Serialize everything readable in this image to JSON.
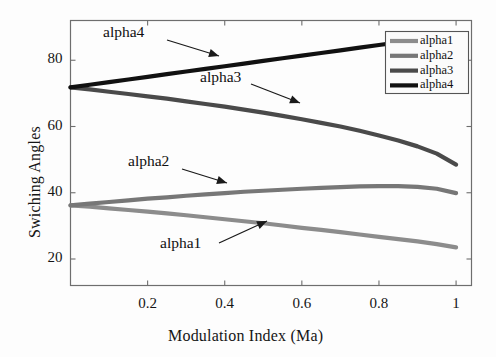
{
  "chart_data": {
    "type": "line",
    "title": "",
    "xlabel": "Modulation Index (Ma)",
    "ylabel": "Swiching Angles",
    "xlim": [
      0,
      1.04
    ],
    "ylim": [
      12,
      92
    ],
    "xticks": [
      0.2,
      0.4,
      0.6,
      0.8,
      1
    ],
    "xticklabels": [
      "0.2",
      "0.4",
      "0.6",
      "0.8",
      "1"
    ],
    "yticks": [
      20,
      40,
      60,
      80
    ],
    "yticklabels": [
      "20",
      "40",
      "60",
      "80"
    ],
    "grid": false,
    "legend_position": "upper right",
    "x": [
      0,
      0.05,
      0.1,
      0.15,
      0.2,
      0.25,
      0.3,
      0.35,
      0.4,
      0.45,
      0.5,
      0.55,
      0.6,
      0.65,
      0.7,
      0.75,
      0.8,
      0.85,
      0.9,
      0.95,
      1
    ],
    "series": [
      {
        "name": "alpha1",
        "color": "#8c8c8c",
        "values": [
          36.2,
          35.8,
          35.3,
          34.8,
          34.3,
          33.8,
          33.2,
          32.6,
          32.0,
          31.4,
          30.8,
          30.1,
          29.4,
          28.8,
          28.1,
          27.4,
          26.7,
          26.0,
          25.3,
          24.5,
          23.5
        ]
      },
      {
        "name": "alpha2",
        "color": "#777777",
        "values": [
          36.2,
          36.7,
          37.2,
          37.7,
          38.2,
          38.6,
          39.1,
          39.5,
          39.9,
          40.3,
          40.6,
          40.9,
          41.2,
          41.5,
          41.7,
          41.9,
          42.0,
          42.0,
          41.8,
          41.2,
          39.9
        ]
      },
      {
        "name": "alpha3",
        "color": "#4a4a4a",
        "values": [
          71.8,
          71.2,
          70.5,
          69.8,
          69.1,
          68.4,
          67.6,
          66.8,
          66.0,
          65.1,
          64.2,
          63.2,
          62.2,
          61.1,
          60.0,
          58.7,
          57.3,
          55.8,
          54.0,
          51.8,
          48.5
        ]
      },
      {
        "name": "alpha4",
        "color": "#111111",
        "values": [
          71.8,
          72.6,
          73.4,
          74.2,
          75.0,
          75.8,
          76.6,
          77.4,
          78.2,
          79.0,
          79.8,
          80.6,
          81.4,
          82.2,
          83.0,
          83.8,
          84.6,
          85.4,
          86.2,
          87.0,
          87.9
        ]
      }
    ],
    "annotations": [
      {
        "text": "alpha4",
        "label_x": 103,
        "label_y": 32,
        "arrow_from_x": 167,
        "arrow_from_y": 40,
        "arrow_to_x": 219,
        "arrow_to_y": 56
      },
      {
        "text": "alpha3",
        "label_x": 200,
        "label_y": 77,
        "arrow_from_x": 251,
        "arrow_from_y": 84,
        "arrow_to_x": 300,
        "arrow_to_y": 103
      },
      {
        "text": "alpha2",
        "label_x": 128,
        "label_y": 161,
        "arrow_from_x": 182,
        "arrow_from_y": 169,
        "arrow_to_x": 227,
        "arrow_to_y": 183
      },
      {
        "text": "alpha1",
        "label_x": 160,
        "label_y": 243,
        "arrow_from_x": 219,
        "arrow_from_y": 243,
        "arrow_to_x": 267,
        "arrow_to_y": 221
      }
    ]
  },
  "legend": {
    "items": [
      {
        "label": "alpha1",
        "color": "#8c8c8c"
      },
      {
        "label": "alpha2",
        "color": "#777777"
      },
      {
        "label": "alpha3",
        "color": "#4a4a4a"
      },
      {
        "label": "alpha4",
        "color": "#111111"
      }
    ]
  },
  "colors": {
    "axis": "#6e6e6e",
    "text": "#151515",
    "background": "#fdfdfd"
  }
}
